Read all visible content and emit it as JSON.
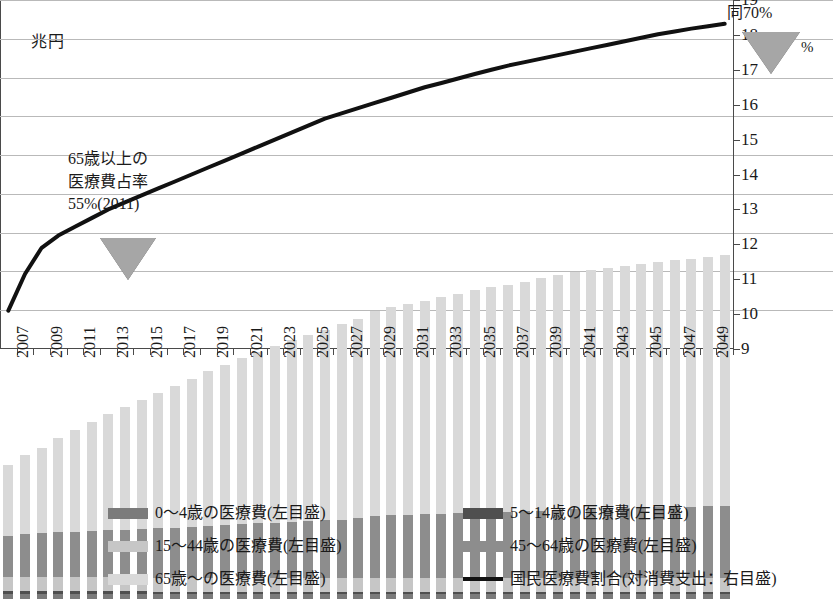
{
  "axis": {
    "left_title": "兆円",
    "right_title": "%",
    "left_ticks": [
      "0",
      "10",
      "20",
      "30",
      "40",
      "50",
      "60",
      "70",
      "80",
      "90"
    ],
    "right_ticks": [
      "9",
      "10",
      "11",
      "12",
      "13",
      "14",
      "15",
      "16",
      "17",
      "18",
      "19"
    ]
  },
  "annotations": {
    "left": {
      "line1": "65歳以上の",
      "line2": "医療費占率",
      "line3": "55%(2011)",
      "marker": "down-triangle"
    },
    "right": {
      "line1": "同70%",
      "marker": "down-triangle"
    }
  },
  "legend": {
    "items": [
      {
        "label": "0～4歳の医療費(左目盛)",
        "color": "#7b7b7b",
        "kind": "swatch"
      },
      {
        "label": "5～14歳の医療費(左目盛)",
        "color": "#4f4f4f",
        "kind": "swatch"
      },
      {
        "label": "15～44歳の医療費(左目盛)",
        "color": "#c6c6c6",
        "kind": "swatch"
      },
      {
        "label": "45～64歳の医療費(左目盛)",
        "color": "#8d8d8d",
        "kind": "swatch"
      },
      {
        "label": "65歳～の医療費(左目盛)",
        "color": "#d9d9d9",
        "kind": "swatch"
      },
      {
        "label": "国民医療費割合(対消費支出：右目盛)",
        "color": "#111111",
        "kind": "line"
      }
    ]
  },
  "chart_data": {
    "type": "bar",
    "subtype": "stacked-bar-plus-line",
    "title": "",
    "xlabel": "",
    "ylabel": "兆円",
    "y2label": "%",
    "ylim": [
      0,
      90
    ],
    "y2lim": [
      9,
      19
    ],
    "grid": true,
    "legend_position": "bottom",
    "categories": [
      "2007",
      "2008",
      "2009",
      "2010",
      "2011",
      "2012",
      "2013",
      "2014",
      "2015",
      "2016",
      "2017",
      "2018",
      "2019",
      "2020",
      "2021",
      "2022",
      "2023",
      "2024",
      "2025",
      "2026",
      "2027",
      "2028",
      "2029",
      "2030",
      "2031",
      "2032",
      "2033",
      "2034",
      "2035",
      "2036",
      "2037",
      "2038",
      "2039",
      "2040",
      "2041",
      "2042",
      "2043",
      "2044",
      "2045",
      "2046",
      "2047",
      "2048",
      "2049",
      "2050"
    ],
    "tick_labels": [
      "2007",
      "2009",
      "2011",
      "2013",
      "2015",
      "2017",
      "2019",
      "2021",
      "2023",
      "2025",
      "2027",
      "2029",
      "2031",
      "2033",
      "2035",
      "2037",
      "2039",
      "2041",
      "2043",
      "2045",
      "2047",
      "2049"
    ],
    "series": [
      {
        "name": "0～4歳の医療費(左目盛)",
        "axis": "left",
        "color": "#7b7b7b",
        "values": [
          1.4,
          1.4,
          1.4,
          1.4,
          1.3,
          1.3,
          1.3,
          1.3,
          1.3,
          1.2,
          1.2,
          1.2,
          1.2,
          1.2,
          1.2,
          1.2,
          1.2,
          1.2,
          1.2,
          1.2,
          1.2,
          1.2,
          1.2,
          1.2,
          1.2,
          1.2,
          1.2,
          1.2,
          1.2,
          1.2,
          1.2,
          1.2,
          1.2,
          1.2,
          1.2,
          1.2,
          1.2,
          1.2,
          1.2,
          1.2,
          1.2,
          1.2,
          1.2,
          1.2
        ]
      },
      {
        "name": "5～14歳の医療費(左目盛)",
        "axis": "left",
        "color": "#4f4f4f",
        "values": [
          0.7,
          0.7,
          0.7,
          0.7,
          0.7,
          0.7,
          0.7,
          0.7,
          0.7,
          0.7,
          0.7,
          0.7,
          0.7,
          0.7,
          0.7,
          0.7,
          0.7,
          0.7,
          0.7,
          0.7,
          0.7,
          0.7,
          0.7,
          0.7,
          0.7,
          0.7,
          0.7,
          0.7,
          0.7,
          0.7,
          0.7,
          0.7,
          0.7,
          0.7,
          0.7,
          0.7,
          0.7,
          0.7,
          0.7,
          0.7,
          0.7,
          0.7,
          0.7,
          0.7
        ]
      },
      {
        "name": "15～44歳の医療費(左目盛)",
        "axis": "left",
        "color": "#c6c6c6",
        "values": [
          3.6,
          3.6,
          3.6,
          3.6,
          3.6,
          3.6,
          3.6,
          3.6,
          3.6,
          3.6,
          3.6,
          3.6,
          3.6,
          3.6,
          3.6,
          3.6,
          3.6,
          3.6,
          3.6,
          3.6,
          3.6,
          3.6,
          3.6,
          3.6,
          3.6,
          3.6,
          3.6,
          3.6,
          3.6,
          3.6,
          3.6,
          3.6,
          3.6,
          3.6,
          3.6,
          3.6,
          3.6,
          3.6,
          3.6,
          3.6,
          3.6,
          3.6,
          3.6,
          3.6
        ]
      },
      {
        "name": "45～64歳の医療費(左目盛)",
        "axis": "left",
        "color": "#8d8d8d",
        "values": [
          10.5,
          11.0,
          11.2,
          11.5,
          11.7,
          11.9,
          12.1,
          12.3,
          12.5,
          12.7,
          12.9,
          13.1,
          13.4,
          13.6,
          13.8,
          14.0,
          14.2,
          14.4,
          14.6,
          14.8,
          15.0,
          15.3,
          15.9,
          16.1,
          16.2,
          16.3,
          16.5,
          16.6,
          16.8,
          16.9,
          17.0,
          17.1,
          17.3,
          17.5,
          17.6,
          17.7,
          17.8,
          17.9,
          18.0,
          18.1,
          18.2,
          18.3,
          18.4,
          18.5
        ]
      },
      {
        "name": "65歳～の医療費(左目盛)",
        "axis": "left",
        "color": "#d9d9d9",
        "values": [
          18.3,
          20.5,
          22.1,
          24.4,
          26.3,
          28.1,
          29.9,
          31.6,
          33.3,
          35.0,
          36.6,
          38.2,
          39.8,
          41.3,
          42.8,
          44.2,
          45.5,
          46.8,
          48.0,
          49.2,
          50.3,
          51.4,
          52.8,
          53.8,
          54.4,
          55.0,
          55.8,
          56.5,
          57.3,
          58.0,
          58.6,
          59.2,
          59.9,
          60.6,
          61.2,
          61.7,
          62.1,
          62.5,
          62.9,
          63.2,
          63.6,
          64.0,
          64.4,
          64.8
        ]
      },
      {
        "name": "国民医療費割合(対消費支出：右目盛)",
        "axis": "right",
        "color": "#111111",
        "unit": "%",
        "values": [
          10.1,
          11.15,
          11.9,
          12.25,
          12.5,
          12.75,
          13.0,
          13.2,
          13.4,
          13.6,
          13.8,
          14.0,
          14.2,
          14.4,
          14.6,
          14.8,
          15.0,
          15.2,
          15.4,
          15.6,
          15.75,
          15.9,
          16.05,
          16.2,
          16.35,
          16.5,
          16.62,
          16.75,
          16.88,
          17.0,
          17.12,
          17.22,
          17.32,
          17.42,
          17.52,
          17.62,
          17.72,
          17.82,
          17.92,
          18.02,
          18.1,
          18.18,
          18.25,
          18.32
        ]
      }
    ],
    "marker_annotations": [
      {
        "label": "65歳以上の医療費占率 55%(2011)",
        "at_category": "2011"
      },
      {
        "label": "同70%",
        "at_category": "2050"
      }
    ]
  }
}
